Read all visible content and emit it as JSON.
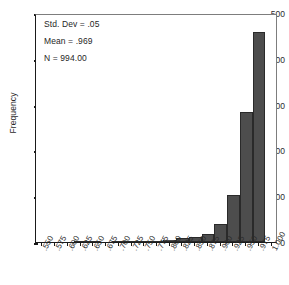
{
  "chart_data": {
    "type": "bar",
    "title": "",
    "subtitle": "",
    "xlabel": "",
    "ylabel": "Frequency",
    "ylim": [
      0,
      500
    ],
    "yticks": [
      0,
      100,
      200,
      300,
      400,
      500
    ],
    "ytick_labels": [
      "0",
      "100",
      "200",
      "300",
      "400",
      "500"
    ],
    "grid": false,
    "legend": false,
    "legend_position": "none",
    "bar_color": "#4d4d4d",
    "bar_edge_color": "#2a2a2a",
    "categories": [
      ".550",
      ".575",
      ".600",
      ".625",
      ".650",
      ".675",
      ".700",
      ".725",
      ".750",
      ".775",
      ".800",
      ".825",
      ".850",
      ".875",
      ".900",
      ".925",
      ".950",
      ".975",
      "1.000"
    ],
    "xtick_labels": [
      ".550",
      ".575",
      ".600",
      ".625",
      ".650",
      ".675",
      ".700",
      ".725",
      ".750",
      ".775",
      ".800",
      ".825",
      ".850",
      ".875",
      ".900",
      ".925",
      ".950",
      ".975",
      "1.000"
    ],
    "values": [
      0,
      0,
      0,
      1,
      1,
      0,
      2,
      1,
      2,
      2,
      4,
      9,
      12,
      18,
      40,
      103,
      284,
      458,
      0
    ],
    "annotations": [
      "Std. Dev = .05",
      "Mean = .969",
      "N = 994.00"
    ]
  },
  "stats": {
    "std_dev": "Std. Dev = .05",
    "mean": "Mean = .969",
    "n": "N = 994.00"
  },
  "axes": {
    "y_title": "Frequency"
  }
}
